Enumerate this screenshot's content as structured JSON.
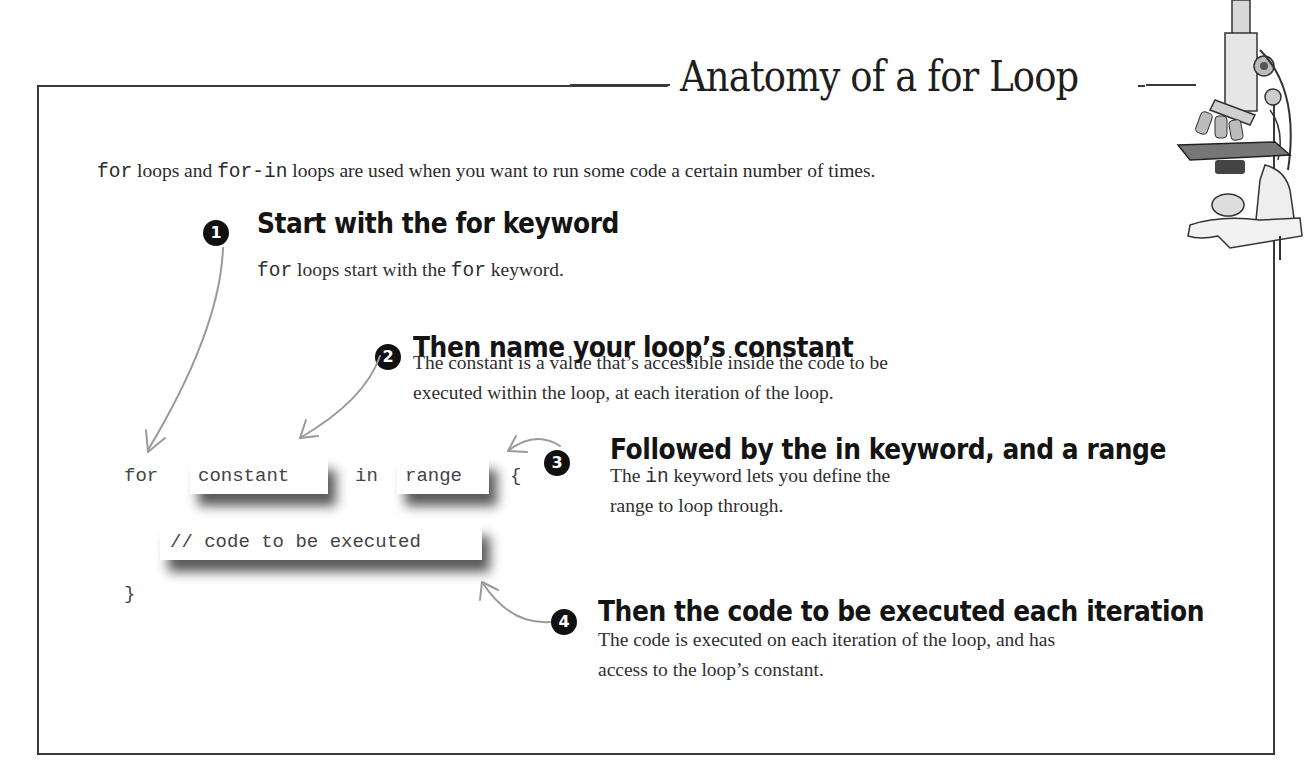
{
  "header": {
    "title": "Anatomy of a for Loop"
  },
  "intro": {
    "code_1": "for",
    "text_1": " loops and ",
    "code_2": "for-in",
    "text_2": " loops are used when you want to run some code a certain number of times."
  },
  "code_sample": {
    "keyword_for": "for",
    "constant": "constant",
    "keyword_in": "in",
    "range": "range",
    "open_brace": "{",
    "body": "// code to be executed",
    "close_brace": "}"
  },
  "steps": [
    {
      "number": "1",
      "heading": "Start with the for keyword",
      "code": "for",
      "text_a": " loops start with the ",
      "code_b": "for",
      "text_b": " keyword."
    },
    {
      "number": "2",
      "heading": "Then name your loop’s constant",
      "line1": "The constant is a value that’s accessible inside the code to be",
      "line2": "executed within the loop, at each iteration of the loop."
    },
    {
      "number": "3",
      "heading": "Followed by the in keyword, and a range",
      "text_a": "The ",
      "code": "in",
      "text_b": " keyword lets you define the",
      "line2": "range to loop through."
    },
    {
      "number": "4",
      "heading": "Then the code to be executed each iteration",
      "line1": "The code is executed on each iteration of the loop, and has",
      "line2": "access to the loop’s constant."
    }
  ],
  "illustration": {
    "icon": "microscope-icon"
  },
  "colors": {
    "border": "#3a3a3a",
    "badge": "#111111",
    "arrow": "#9a9a9a",
    "text": "#2f2f2f"
  }
}
